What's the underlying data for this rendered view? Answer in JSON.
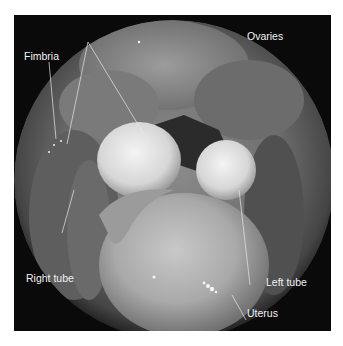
{
  "figure": {
    "labels": [
      {
        "id": "fimbria",
        "text": "Fimbria"
      },
      {
        "id": "ovaries",
        "text": "Ovaries"
      },
      {
        "id": "right-tube",
        "text": "Right tube"
      },
      {
        "id": "left-tube",
        "text": "Left tube"
      },
      {
        "id": "uterus",
        "text": "Uterus"
      }
    ],
    "colors": {
      "background": "#ffffff",
      "frame": "#0a0a0a",
      "label_text": "#f2f2f2",
      "leader_line": "#e8e8e8"
    }
  }
}
